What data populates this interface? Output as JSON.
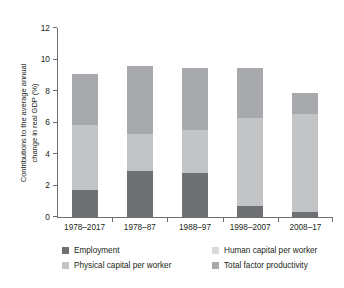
{
  "chart_data": {
    "type": "bar",
    "stacked": true,
    "title": "",
    "subtitle": "",
    "xlabel": "",
    "ylabel": "Contributions to the average annual change in real GDP (%)",
    "ylabel_lines": [
      "Contributions to the average annual",
      "change in real GDP (%)"
    ],
    "categories": [
      "1978–2017",
      "1978–87",
      "1988–97",
      "1998–2007",
      "2008–17"
    ],
    "ylim": [
      0,
      12
    ],
    "yticks": [
      0,
      2,
      4,
      6,
      8,
      10,
      12
    ],
    "ytick_labels": [
      "0",
      "2",
      "4",
      "6",
      "8",
      "10",
      "12"
    ],
    "grid": false,
    "legend_position": "bottom",
    "series": [
      {
        "name": "Employment",
        "color": "#6f7073",
        "values": [
          1.7,
          2.9,
          2.8,
          0.7,
          0.3
        ]
      },
      {
        "name": "Physical capital per worker",
        "color": "#c3c4c6",
        "values": [
          4.15,
          2.4,
          2.75,
          5.6,
          6.25
        ]
      },
      {
        "name": "Human capital per worker",
        "color": "#d9dadb",
        "values": [
          0.0,
          0.0,
          0.0,
          0.0,
          0.0
        ]
      },
      {
        "name": "Total factor productivity",
        "color": "#a7a9ac",
        "values": [
          3.2,
          4.3,
          3.9,
          3.15,
          1.35
        ]
      }
    ],
    "totals": [
      9.05,
      9.6,
      9.45,
      9.45,
      7.9
    ]
  },
  "legend": {
    "items": [
      {
        "label": "Employment",
        "color": "#6f7073"
      },
      {
        "label": "Human capital per worker",
        "color": "#d9dadb"
      },
      {
        "label": "Physical capital per worker",
        "color": "#c3c4c6"
      },
      {
        "label": "Total factor productivity",
        "color": "#a7a9ac"
      }
    ]
  }
}
